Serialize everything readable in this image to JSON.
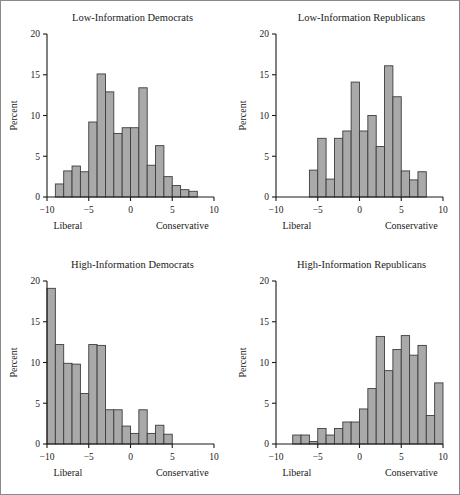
{
  "figure": {
    "layout": "2x2-panel-histogram-grid",
    "bar_color": "#a9a9a9",
    "bar_edge_color": "#3d3d3d",
    "axis_color": "#1a1a1a",
    "frame_color": "#8a8a8a",
    "background": "#ffffff"
  },
  "chart_data": [
    {
      "type": "bar",
      "panel": "top-left",
      "title": "Low-Information Democrats",
      "xlabel": "",
      "ylabel": "Percent",
      "xlim": [
        -10,
        10
      ],
      "ylim": [
        0,
        20
      ],
      "xticks": [
        -10,
        -5,
        0,
        5,
        10
      ],
      "xticklabels": [
        "−10",
        "−5",
        "0",
        "5",
        "10"
      ],
      "yticks": [
        0,
        5,
        10,
        15,
        20
      ],
      "yticklabels": [
        "0",
        "5",
        "10",
        "15",
        "20"
      ],
      "grid": false,
      "legend": null,
      "axis_end_labels": {
        "left": "Liberal",
        "right": "Conservative"
      },
      "bin_width": 1,
      "bin_starts": [
        -9,
        -8,
        -7,
        -6,
        -5,
        -4,
        -3,
        -2,
        -1,
        0,
        1,
        2,
        3,
        4,
        5,
        6,
        7
      ],
      "values": [
        1.6,
        3.2,
        3.8,
        3.1,
        9.2,
        15.1,
        12.9,
        7.8,
        8.5,
        8.5,
        13.4,
        3.9,
        6.3,
        2.5,
        1.4,
        0.9,
        0.7
      ]
    },
    {
      "type": "bar",
      "panel": "top-right",
      "title": "Low-Information Republicans",
      "xlabel": "",
      "ylabel": "Percent",
      "xlim": [
        -10,
        10
      ],
      "ylim": [
        0,
        20
      ],
      "xticks": [
        -10,
        -5,
        0,
        5,
        10
      ],
      "xticklabels": [
        "−10",
        "−5",
        "0",
        "5",
        "10"
      ],
      "yticks": [
        0,
        5,
        10,
        15,
        20
      ],
      "yticklabels": [
        "0",
        "5",
        "10",
        "15",
        "20"
      ],
      "grid": false,
      "legend": null,
      "axis_end_labels": {
        "left": "Liberal",
        "right": "Conservative"
      },
      "bin_width": 1,
      "bin_starts": [
        -6,
        -5,
        -4,
        -3,
        -2,
        -1,
        0,
        1,
        2,
        3,
        4,
        5,
        6,
        7
      ],
      "values": [
        3.3,
        7.2,
        2.2,
        7.2,
        8.1,
        14.1,
        8.1,
        10.0,
        6.2,
        16.1,
        12.3,
        3.2,
        2.1,
        3.1
      ]
    },
    {
      "type": "bar",
      "panel": "bottom-left",
      "title": "High-Information Democrats",
      "xlabel": "",
      "ylabel": "Percent",
      "xlim": [
        -10,
        10
      ],
      "ylim": [
        0,
        20
      ],
      "xticks": [
        -10,
        -5,
        0,
        5,
        10
      ],
      "xticklabels": [
        "−10",
        "−5",
        "0",
        "5",
        "10"
      ],
      "yticks": [
        0,
        5,
        10,
        15,
        20
      ],
      "yticklabels": [
        "0",
        "5",
        "10",
        "15",
        "20"
      ],
      "grid": false,
      "legend": null,
      "axis_end_labels": {
        "left": "Liberal",
        "right": "Conservative"
      },
      "bin_width": 1,
      "bin_starts": [
        -10,
        -9,
        -8,
        -7,
        -6,
        -5,
        -4,
        -3,
        -2,
        -1,
        0,
        1,
        2,
        3,
        4
      ],
      "values": [
        19.1,
        12.2,
        9.9,
        9.8,
        6.2,
        12.2,
        12.1,
        4.2,
        4.2,
        2.2,
        1.3,
        4.2,
        1.3,
        2.3,
        1.2
      ]
    },
    {
      "type": "bar",
      "panel": "bottom-right",
      "title": "High-Information Republicans",
      "xlabel": "",
      "ylabel": "Percent",
      "xlim": [
        -10,
        10
      ],
      "ylim": [
        0,
        20
      ],
      "xticks": [
        -10,
        -5,
        0,
        5,
        10
      ],
      "xticklabels": [
        "−10",
        "−5",
        "0",
        "5",
        "10"
      ],
      "yticks": [
        0,
        5,
        10,
        15,
        20
      ],
      "yticklabels": [
        "0",
        "5",
        "10",
        "15",
        "20"
      ],
      "grid": false,
      "legend": null,
      "axis_end_labels": {
        "left": "Liberal",
        "right": "Conservative"
      },
      "bin_width": 1,
      "bin_starts": [
        -8,
        -7,
        -6,
        -5,
        -4,
        -3,
        -2,
        -1,
        0,
        1,
        2,
        3,
        4,
        5,
        6,
        7,
        8,
        9
      ],
      "values": [
        1.1,
        1.1,
        0.3,
        1.9,
        1.1,
        1.9,
        2.7,
        2.7,
        4.3,
        6.8,
        13.2,
        9.0,
        11.6,
        13.3,
        10.9,
        12.1,
        3.5,
        7.5
      ]
    }
  ]
}
